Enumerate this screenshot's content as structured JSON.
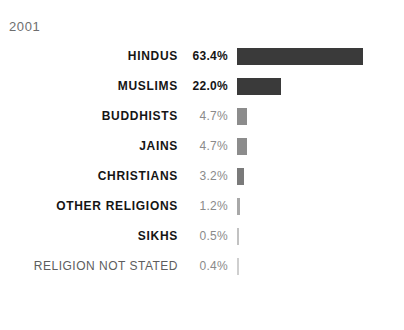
{
  "title": "IC'S MAIN RELIGIONS",
  "subtitle": "2001",
  "chart_data": {
    "type": "bar",
    "title": "IC'S MAIN RELIGIONS",
    "subtitle": "2001",
    "xlabel": "",
    "ylabel": "",
    "xlim": [
      0,
      63.4
    ],
    "grid": false,
    "legend": "none",
    "orientation": "horizontal",
    "value_suffix": "%",
    "categories": [
      "HINDUS",
      "MUSLIMS",
      "BUDDHISTS",
      "JAINS",
      "CHRISTIANS",
      "OTHER RELIGIONS",
      "SIKHS",
      "RELIGION NOT STATED"
    ],
    "values": [
      63.4,
      22.0,
      4.7,
      4.7,
      3.2,
      1.2,
      0.5,
      0.4
    ],
    "value_labels": [
      "63.4%",
      "22.0%",
      "4.7%",
      "4.7%",
      "3.2%",
      "1.2%",
      "0.5%",
      "0.4%"
    ],
    "bar_colors": [
      "#3a3a3a",
      "#3a3a3a",
      "#8c8c8c",
      "#8c8c8c",
      "#7a7a7a",
      "#a8a8a8",
      "#c2c2c2",
      "#cfcfcf"
    ],
    "rows": [
      {
        "label": "HINDUS",
        "value_label": "63.4%",
        "value": 63.4,
        "bar_width_px": 126,
        "bar_color": "#3a3a3a",
        "muted_label": false,
        "small_value": false
      },
      {
        "label": "MUSLIMS",
        "value_label": "22.0%",
        "value": 22.0,
        "bar_width_px": 44,
        "bar_color": "#3a3a3a",
        "muted_label": false,
        "small_value": false
      },
      {
        "label": "BUDDHISTS",
        "value_label": "4.7%",
        "value": 4.7,
        "bar_width_px": 10,
        "bar_color": "#8c8c8c",
        "muted_label": false,
        "small_value": true
      },
      {
        "label": "JAINS",
        "value_label": "4.7%",
        "value": 4.7,
        "bar_width_px": 10,
        "bar_color": "#8c8c8c",
        "muted_label": false,
        "small_value": true
      },
      {
        "label": "CHRISTIANS",
        "value_label": "3.2%",
        "value": 3.2,
        "bar_width_px": 7,
        "bar_color": "#7a7a7a",
        "muted_label": false,
        "small_value": true
      },
      {
        "label": "OTHER RELIGIONS",
        "value_label": "1.2%",
        "value": 1.2,
        "bar_width_px": 3,
        "bar_color": "#a8a8a8",
        "muted_label": false,
        "small_value": true
      },
      {
        "label": "SIKHS",
        "value_label": "0.5%",
        "value": 0.5,
        "bar_width_px": 2,
        "bar_color": "#c2c2c2",
        "muted_label": false,
        "small_value": true
      },
      {
        "label": "RELIGION NOT STATED",
        "value_label": "0.4%",
        "value": 0.4,
        "bar_width_px": 2,
        "bar_color": "#cfcfcf",
        "muted_label": true,
        "small_value": true
      }
    ]
  }
}
